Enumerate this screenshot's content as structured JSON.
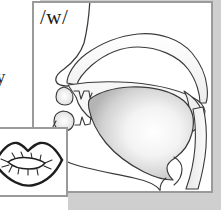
{
  "figure": {
    "kind": "articulatory-phonetics-diagram",
    "phoneme_label": "/w/",
    "edge_fragment_text": "y",
    "background_color": "#ffffff",
    "shadow_color": "#cfcfcf",
    "frame_border_color": "#9a9a9a",
    "outline_color": "#2a2a2a"
  },
  "main_panel": {
    "name": "sagittal-section-panel",
    "label": "/w/",
    "parts": [
      {
        "name": "nose-profile",
        "label": "nose"
      },
      {
        "name": "nasal-cavity",
        "label": "nasal cavity"
      },
      {
        "name": "hard-palate",
        "label": "hard palate"
      },
      {
        "name": "soft-palate-velum",
        "label": "velum"
      },
      {
        "name": "upper-lip",
        "label": "upper lip"
      },
      {
        "name": "upper-teeth",
        "label": "upper teeth"
      },
      {
        "name": "lower-lip",
        "label": "lower lip"
      },
      {
        "name": "lower-teeth",
        "label": "lower teeth"
      },
      {
        "name": "tongue-body",
        "label": "tongue"
      },
      {
        "name": "pharynx-wall",
        "label": "pharyngeal wall"
      },
      {
        "name": "epiglottis",
        "label": "epiglottis"
      },
      {
        "name": "jaw-chin-outline",
        "label": "jaw"
      }
    ]
  },
  "lips_panel": {
    "name": "lips-front-view-panel",
    "label": "rounded lips",
    "parts": [
      {
        "name": "upper-lip-outline",
        "label": "upper lip"
      },
      {
        "name": "lower-lip-outline",
        "label": "lower lip"
      },
      {
        "name": "mouth-aperture",
        "label": "mouth opening"
      }
    ]
  }
}
